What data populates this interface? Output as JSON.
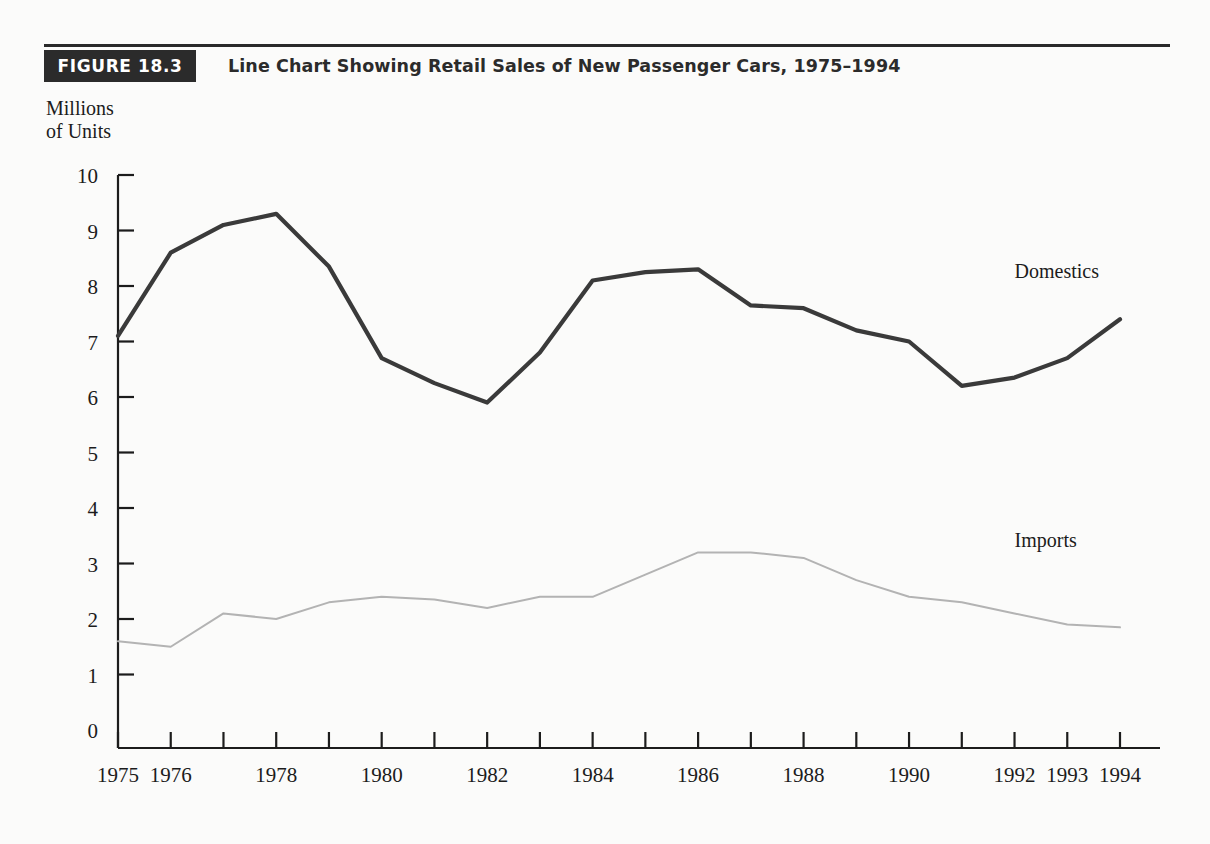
{
  "figure": {
    "tag": "FIGURE 18.3",
    "title": "Line Chart Showing Retail Sales of New Passenger Cars, 1975–1994"
  },
  "axis_caption": "Millions\nof Units",
  "colors": {
    "ink": "#1c1c1c",
    "tag_background": "#2b2b2b",
    "tag_text": "#ffffff",
    "domestics_line": "#3a3a3a",
    "imports_line": "#b3b3b3",
    "page_background": "#fbfbfa"
  },
  "chart_data": {
    "type": "line",
    "title": "Line Chart Showing Retail Sales of New Passenger Cars, 1975–1994",
    "xlabel": "",
    "ylabel": "Millions of Units",
    "ylim": [
      0,
      10
    ],
    "yticks": [
      0,
      1,
      2,
      3,
      4,
      5,
      6,
      7,
      8,
      9,
      10
    ],
    "ytick_labels": [
      "0",
      "1",
      "2",
      "3",
      "4",
      "5",
      "6",
      "7",
      "8",
      "9",
      "10"
    ],
    "grid": false,
    "legend_position": "inline-right",
    "categories": [
      "1975",
      "1976",
      "1977",
      "1978",
      "1979",
      "1980",
      "1981",
      "1982",
      "1983",
      "1984",
      "1985",
      "1986",
      "1987",
      "1988",
      "1989",
      "1990",
      "1991",
      "1992",
      "1993",
      "1994"
    ],
    "xtick_labels": [
      "1975",
      "1976",
      "",
      "1978",
      "",
      "1980",
      "",
      "1982",
      "",
      "1984",
      "",
      "1986",
      "",
      "1988",
      "",
      "1990",
      "",
      "1992",
      "1993",
      "1994"
    ],
    "series": [
      {
        "name": "Domestics",
        "color": "#3a3a3a",
        "values": [
          7.1,
          8.6,
          9.1,
          9.3,
          8.35,
          6.7,
          6.25,
          5.9,
          6.8,
          8.1,
          8.25,
          8.3,
          7.65,
          7.6,
          7.2,
          7.0,
          6.2,
          6.35,
          6.7,
          7.4
        ]
      },
      {
        "name": "Imports",
        "color": "#b3b3b3",
        "values": [
          1.6,
          1.5,
          2.1,
          2.0,
          2.3,
          2.4,
          2.35,
          2.2,
          2.4,
          2.4,
          2.8,
          3.2,
          3.2,
          3.1,
          2.7,
          2.4,
          2.3,
          2.1,
          1.9,
          1.85
        ]
      }
    ],
    "annotations": [
      {
        "text": "Domestics",
        "x": "1992",
        "y": 8.15
      },
      {
        "text": "Imports",
        "x": "1992",
        "y": 3.3
      }
    ]
  }
}
